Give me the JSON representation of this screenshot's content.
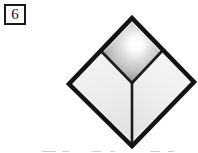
{
  "figure": {
    "label": "6",
    "label_box": {
      "border_color": "#1a1a1a",
      "background": "#ffffff"
    },
    "shape_name": "diamond-three-rhombi",
    "outline_color": "#111111",
    "outline_width_px": 4,
    "vertices": {
      "top": [
        132,
        18
      ],
      "left": [
        69,
        84
      ],
      "right": [
        194,
        82
      ],
      "bottom": [
        132,
        146
      ],
      "center": [
        132,
        83
      ],
      "upper_left_mid": [
        101,
        51
      ],
      "upper_right_mid": [
        163,
        50
      ]
    },
    "faces": [
      {
        "name": "top-face",
        "fill_type": "radial-gradient",
        "highlight_color": "#ffffff",
        "mid_color": "#c9c9c9",
        "edge_color": "#8d8d8d",
        "highlight_center_pct": [
          56,
          40
        ]
      },
      {
        "name": "left-face",
        "fill_type": "linear-gradient",
        "top_color": "#f4f4f4",
        "bottom_color": "#e4e4e4"
      },
      {
        "name": "right-face",
        "fill_type": "linear-gradient",
        "top_color": "#f6f6f6",
        "bottom_color": "#e6e6e6"
      }
    ],
    "interior_edges": [
      {
        "name": "edge-center-to-upper-left",
        "from": [
          132,
          83
        ],
        "to": [
          101,
          51
        ]
      },
      {
        "name": "edge-center-to-upper-right",
        "from": [
          132,
          83
        ],
        "to": [
          163,
          50
        ]
      },
      {
        "name": "edge-center-to-bottom",
        "from": [
          132,
          83
        ],
        "to": [
          132,
          146
        ]
      }
    ],
    "bottom_text_remnant": {
      "visible": true,
      "description": "faint tops of a cut-off line of text at the very bottom edge, illegible",
      "color": "#cfcfcf",
      "segments": [
        {
          "left": 42,
          "width": 14
        },
        {
          "left": 62,
          "width": 7
        },
        {
          "left": 92,
          "width": 9
        },
        {
          "left": 110,
          "width": 5
        },
        {
          "left": 150,
          "width": 10
        },
        {
          "left": 168,
          "width": 6
        }
      ]
    }
  },
  "page": {
    "background": "#ffffff",
    "width": 198,
    "height": 153
  }
}
